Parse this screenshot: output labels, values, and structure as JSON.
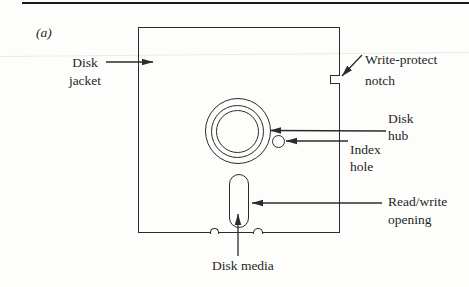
{
  "colors": {
    "ink": "#1f1f1f",
    "line": "#2b2b2b",
    "background": "#fdfdfb",
    "top_rule": "#1c1c1c"
  },
  "panel_label": "(a)",
  "labels": {
    "disk_jacket": {
      "line1": "Disk",
      "line2": "jacket"
    },
    "write_protect_notch": {
      "line1": "Write-protect",
      "line2": "notch"
    },
    "disk_hub": {
      "line1": "Disk",
      "line2": "hub"
    },
    "index_hole": {
      "line1": "Index",
      "line2": "hole"
    },
    "read_write_opening": {
      "line1": "Read/write",
      "line2": "opening"
    },
    "disk_media": "Disk media"
  }
}
